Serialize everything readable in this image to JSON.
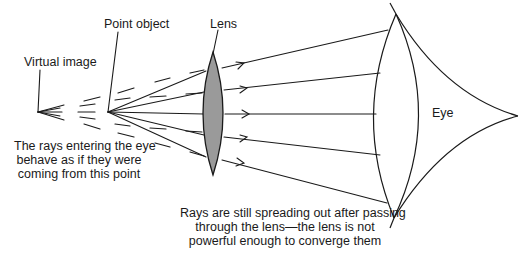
{
  "labels": {
    "virtual_image": "Virtual image",
    "point_object": "Point object",
    "lens": "Lens",
    "eye": "Eye",
    "rays_note": [
      "The rays entering the eye",
      "behave as if they were",
      "coming from this point"
    ],
    "spreading_note": [
      "Rays are still spreading out after passing",
      "through the lens—the lens is not",
      "powerful enough to converge them"
    ]
  },
  "colors": {
    "line": "#1a1a1a",
    "lens_fill": "#9a9a9a",
    "background": "#ffffff"
  },
  "geometry": {
    "virtual_image_point": [
      38,
      112
    ],
    "point_object": [
      108,
      112
    ],
    "lens_top": [
      213,
      52
    ],
    "lens_bottom": [
      213,
      175
    ],
    "eye_tip": [
      518,
      116
    ]
  }
}
